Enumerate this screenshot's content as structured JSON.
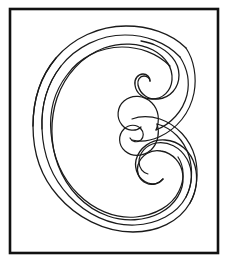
{
  "page": {
    "kind": "coloring-page",
    "letter": "C",
    "style": "ornate-calligraphic-outline",
    "width": 228,
    "height": 263,
    "background_color": "#ffffff"
  },
  "frame": {
    "name": "border-rectangle",
    "stroke_color": "#111111",
    "fill_color": "#ffffff",
    "stroke_width": 2.6,
    "x": 10,
    "y": 9,
    "width": 208,
    "height": 244
  },
  "artwork": {
    "name": "letter-c-glyph",
    "stroke_color": "#1a1a1a",
    "fill_color": "none",
    "stroke_width": 1.3,
    "bounds": {
      "x": 32,
      "y": 26,
      "width": 165,
      "height": 206
    },
    "paths": [
      {
        "id": "outer-contour",
        "label": "outermost-outline-of-c",
        "d": "M186 48 C171 33 148 26 126 26 C99 26 73 38 56 58 C40 77 33 101 33 126 C33 152 41 177 58 196 C76 217 104 232 133 232 C157 232 179 222 190 203 C197 191 198 177 195 166 C191 151 179 141 165 140 C151 139 139 148 136 160 C134 170 139 180 148 183 C154 185 160 183 163 179 C159 184 152 186 146 183 C139 180 136 172 138 165 C141 155 151 149 161 151 C173 153 182 163 183 176 C184 191 175 205 160 213 C145 221 125 222 108 216 C85 208 67 189 58 165 C50 144 50 119 57 98 C65 75 82 56 104 48 C121 42 139 43 153 50 C166 57 173 68 172 80 C171 91 163 99 152 99 C143 99 136 93 135 85 C134 79 138 74 143 74 C147 74 150 77 150 81 C150 78 147 76 144 76 C140 76 137 80 138 85 C140 94 148 100 158 99 C170 98 179 88 179 75 C179 62 169 51 155 45 C151 43 146 42 141 41"
      },
      {
        "id": "mid-contour",
        "label": "middle-parallel-outline",
        "d": "M180 57 C166 42 145 35 125 35 C100 35 76 47 61 66 C47 84 41 106 42 129 C43 154 52 178 69 196 C86 214 110 226 135 225 C157 224 177 214 186 197 C193 184 193 170 187 159 C180 147 168 141 156 143 C146 145 139 153 139 162 C139 168 143 173 148 174"
      },
      {
        "id": "inner-contour",
        "label": "innermost-parallel-outline",
        "d": "M170 66 C157 53 139 47 122 47 C100 47 79 58 67 75 C54 92 49 112 51 133 C53 156 62 178 78 194 C93 209 114 219 136 217 C155 215 172 206 179 191 C185 179 184 166 178 157"
      },
      {
        "id": "upper-curl-inner-spiral",
        "label": "upper-terminal-spiral-hook",
        "d": "M163 179 C170 171 172 160 167 151 C162 142 152 137 142 139 C131 141 124 150 124 160 C124 172 133 181 145 182"
      },
      {
        "id": "lower-curl-inner-spiral",
        "label": "lower-terminal-spiral-hook",
        "d": "M148 174 C139 175 131 170 128 162 C124 152 128 141 137 136 C147 130 160 132 168 140 C177 149 179 162 174 173"
      },
      {
        "id": "upper-curl-outer-sweep",
        "label": "upper-curl-outer-arc",
        "d": "M186 48 C194 60 197 76 194 92 C190 112 177 128 160 136"
      },
      {
        "id": "lower-curl-outer-sweep",
        "label": "lower-curl-outer-arc",
        "d": "M190 203 C196 190 198 174 194 159 C189 141 177 127 161 121"
      }
    ]
  }
}
